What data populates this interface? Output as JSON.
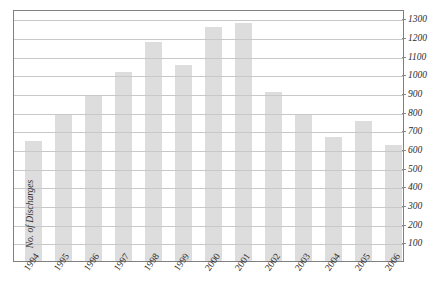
{
  "chart_data": {
    "type": "bar",
    "title": "",
    "xlabel": "",
    "ylabel": "No. of Discharges",
    "categories": [
      "1994",
      "1995",
      "1996",
      "1997",
      "1998",
      "1999",
      "2000",
      "2001",
      "2002",
      "2003",
      "2004",
      "2005",
      "2006"
    ],
    "values": [
      645,
      780,
      885,
      1010,
      1175,
      1050,
      1255,
      1275,
      905,
      780,
      665,
      750,
      620
    ],
    "series": [
      {
        "name": "No. of Discharges",
        "values": [
          645,
          780,
          885,
          1010,
          1175,
          1050,
          1255,
          1275,
          905,
          780,
          665,
          750,
          620
        ]
      }
    ],
    "ylim": [
      0,
      1350
    ],
    "ytick_labels": [
      "100",
      "200",
      "300",
      "400",
      "500",
      "600",
      "700",
      "800",
      "900",
      "1000",
      "1100",
      "1200",
      "1300"
    ],
    "ytick_values": [
      100,
      200,
      300,
      400,
      500,
      600,
      700,
      800,
      900,
      1000,
      1100,
      1200,
      1300
    ],
    "grid": true,
    "legend": "none",
    "y_axis_position": "right",
    "bar_color": "#c8c8c8",
    "gridline_color": "#c8c8c8",
    "frame_color": "#7f7f7f",
    "text_color": "#2b2b2b"
  },
  "axes": {
    "y_title": "No. of Discharges"
  },
  "caption": {
    "text": ""
  }
}
